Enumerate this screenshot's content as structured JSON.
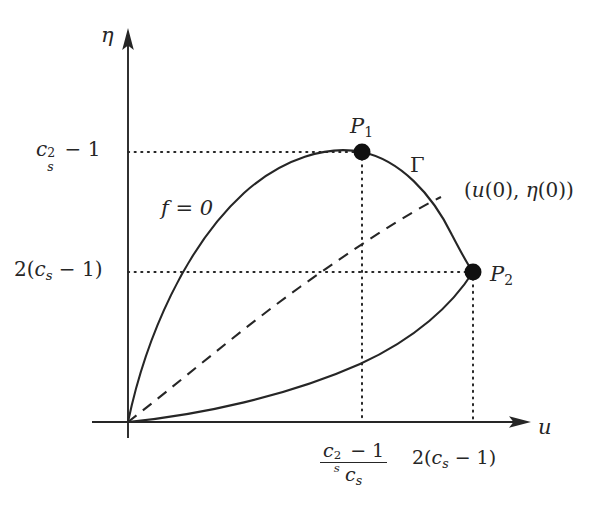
{
  "figure": {
    "type": "mathematical-phase-diagram",
    "background_color": "#ffffff",
    "stroke_color": "#262626",
    "axes": {
      "x_axis": {
        "label": "u",
        "name": "u-axis",
        "arrow": true
      },
      "y_axis": {
        "label": "η",
        "name": "eta-axis",
        "arrow": true
      },
      "origin_px": [
        128,
        422
      ]
    },
    "curves": [
      {
        "name": "f-equals-zero-upper-branch",
        "label": "f = 0",
        "style": "solid",
        "description": "upper arc of teardrop from origin through P1 to P2"
      },
      {
        "name": "lower-branch",
        "label": "",
        "style": "solid",
        "description": "lower arc of teardrop from origin to P2"
      },
      {
        "name": "trajectory-dashed",
        "label": "",
        "style": "dashed",
        "description": "dashed curve from origin to point (u(0), eta(0)) on Gamma"
      }
    ],
    "gamma_label": "Γ",
    "initial_point_label_parts": {
      "open": "(",
      "u_fn": "u",
      "u_arg": "(0)",
      "comma": ", ",
      "eta_fn": "η",
      "eta_arg": "(0)",
      "close": ")"
    },
    "points": [
      {
        "name": "P1",
        "label": "P",
        "sub": "1",
        "px": [
          362,
          152
        ],
        "filled": true
      },
      {
        "name": "P2",
        "label": "P",
        "sub": "2",
        "px": [
          473,
          272
        ],
        "filled": true
      }
    ],
    "ticks": {
      "y_axis": [
        {
          "name": "y-tick-cs-squared-minus-1",
          "text_parts": {
            "base": "c",
            "sup": "2",
            "sub": "s",
            "rest": " − 1"
          },
          "plain": "c_s^2 − 1",
          "y_px": 152
        },
        {
          "name": "y-tick-2-cs-minus-1",
          "text_parts": {
            "prefix": "2(",
            "base": "c",
            "sub": "s",
            "rest": " − 1)"
          },
          "plain": "2(c_s − 1)",
          "y_px": 272
        }
      ],
      "x_axis": [
        {
          "name": "x-tick-fraction",
          "numerator": {
            "base": "c",
            "sup": "2",
            "sub": "s",
            "rest": " − 1"
          },
          "denominator": {
            "base": "c",
            "sub": "s"
          },
          "plain": "(c_s^2 − 1)/c_s",
          "x_px": 362
        },
        {
          "name": "x-tick-2-cs-minus-1",
          "text_parts": {
            "prefix": "2(",
            "base": "c",
            "sub": "s",
            "rest": " − 1)"
          },
          "plain": "2(c_s − 1)",
          "x_px": 473
        }
      ]
    },
    "guide_lines": {
      "style": "dotted",
      "horizontal": [
        {
          "name": "hline-cs2-minus-1",
          "from_px": [
            128,
            152
          ],
          "to_px": [
            362,
            152
          ]
        },
        {
          "name": "hline-2cs-minus-1",
          "from_px": [
            128,
            272
          ],
          "to_px": [
            473,
            272
          ]
        }
      ],
      "vertical": [
        {
          "name": "vline-from-P1",
          "from_px": [
            362,
            152
          ],
          "to_px": [
            362,
            422
          ]
        },
        {
          "name": "vline-from-P2",
          "from_px": [
            473,
            272
          ],
          "to_px": [
            473,
            422
          ]
        }
      ]
    }
  }
}
